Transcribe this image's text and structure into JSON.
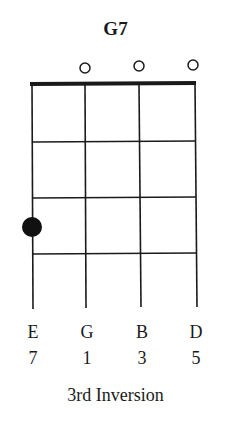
{
  "chord": {
    "name": "G7",
    "caption": "3rd Inversion",
    "strings": [
      {
        "note": "E",
        "degree": "7",
        "open": false,
        "fret": 3
      },
      {
        "note": "G",
        "degree": "1",
        "open": true,
        "fret": 0
      },
      {
        "note": "B",
        "degree": "3",
        "open": true,
        "fret": 0
      },
      {
        "note": "D",
        "degree": "5",
        "open": true,
        "fret": 0
      }
    ],
    "frets_shown": 4
  }
}
